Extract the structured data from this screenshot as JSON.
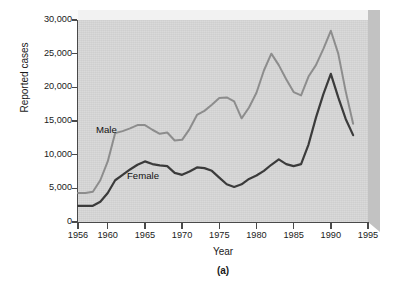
{
  "figure": {
    "caption": "(a)",
    "xlabel": "Year",
    "ylabel": "Reported cases"
  },
  "colors": {
    "male_line": "#8d8d8d",
    "female_line": "#3b3b3b",
    "plot_background": "#d6d6d6",
    "axis": "#4a4a4a",
    "text": "#1a1a1a"
  },
  "axes": {
    "y_ticks": [
      "0",
      "5,000",
      "10,000",
      "15,000",
      "20,000",
      "25,000",
      "30,000"
    ],
    "x_ticks": [
      "1956",
      "1960",
      "1965",
      "1970",
      "1975",
      "1980",
      "1985",
      "1990",
      "1995"
    ]
  },
  "series_labels": {
    "male": "Male",
    "female": "Female"
  },
  "chart_data": {
    "type": "line",
    "title": "",
    "xlabel": "Year",
    "ylabel": "Reported cases",
    "xlim": [
      1956,
      1995
    ],
    "ylim": [
      0,
      30000
    ],
    "grid": false,
    "legend": "inline-annotations",
    "x": [
      1956,
      1957,
      1958,
      1959,
      1960,
      1961,
      1962,
      1963,
      1964,
      1965,
      1966,
      1967,
      1968,
      1969,
      1970,
      1971,
      1972,
      1973,
      1974,
      1975,
      1976,
      1977,
      1978,
      1979,
      1980,
      1981,
      1982,
      1983,
      1984,
      1985,
      1986,
      1987,
      1988,
      1989,
      1990,
      1991,
      1992,
      1993
    ],
    "series": [
      {
        "name": "Male",
        "color": "#8d8d8d",
        "values": [
          4300,
          4300,
          4500,
          6200,
          9000,
          13200,
          13500,
          13900,
          14400,
          14400,
          13700,
          13100,
          13300,
          12100,
          12200,
          13800,
          15900,
          16500,
          17400,
          18400,
          18500,
          17900,
          15400,
          17000,
          19200,
          22500,
          25000,
          23300,
          21200,
          19300,
          18800,
          21600,
          23300,
          25700,
          28400,
          25000,
          19400,
          14600
        ]
      },
      {
        "name": "Female",
        "color": "#3b3b3b",
        "values": [
          2400,
          2400,
          2400,
          3000,
          4300,
          6200,
          7000,
          7800,
          8500,
          9000,
          8600,
          8400,
          8300,
          7300,
          7000,
          7500,
          8100,
          8000,
          7600,
          6600,
          5600,
          5200,
          5600,
          6400,
          6900,
          7600,
          8500,
          9300,
          8600,
          8300,
          8600,
          11500,
          15500,
          19000,
          22000,
          18500,
          15300,
          12900
        ]
      }
    ],
    "annotations": [
      {
        "text": "Male",
        "x": 1960,
        "y": 16000
      },
      {
        "text": "Female",
        "x": 1966,
        "y": 6500
      }
    ]
  }
}
